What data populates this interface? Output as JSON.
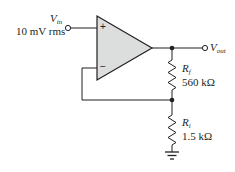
{
  "diagram": {
    "type": "non-inverting-amplifier",
    "colors": {
      "line": "#231f20",
      "opamp_fill": "#dcdddd"
    },
    "opamp": {
      "plus_symbol": "+",
      "minus_symbol": "−"
    },
    "input": {
      "symbol": "V",
      "subscript": "in",
      "value": "10 mV rms"
    },
    "output": {
      "symbol": "V",
      "subscript": "out"
    },
    "resistors": [
      {
        "id": "Rf",
        "symbol": "R",
        "subscript": "f",
        "value": "560 kΩ"
      },
      {
        "id": "Ri",
        "symbol": "R",
        "subscript": "i",
        "value": "1.5 kΩ"
      }
    ],
    "ground": {
      "icon": "ground-icon"
    }
  }
}
